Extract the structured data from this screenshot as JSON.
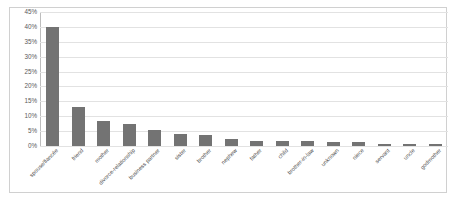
{
  "chart_data": {
    "type": "bar",
    "title": "",
    "subtitle": "",
    "xlabel": "",
    "ylabel": "",
    "ylim": [
      0,
      45
    ],
    "ytick_labels": [
      "0%",
      "5%",
      "10%",
      "15%",
      "20%",
      "25%",
      "30%",
      "35%",
      "40%",
      "45%"
    ],
    "ytick_values": [
      0,
      5,
      10,
      15,
      20,
      25,
      30,
      35,
      40,
      45
    ],
    "grid": true,
    "legend": null,
    "legend_position": "none",
    "bar_color": "#737373",
    "gridline_color": "#e2e2e2",
    "categories": [
      "spouse/fiancée",
      "friend",
      "mother",
      "divorce-relationship",
      "business partner",
      "sister",
      "brother",
      "nephew",
      "father",
      "child",
      "brother-in-law",
      "unknown",
      "niece",
      "servant",
      "uncle",
      "godmother"
    ],
    "values": [
      40,
      13,
      8.5,
      7.5,
      5.5,
      4,
      3.8,
      2.2,
      1.8,
      1.7,
      1.6,
      1.5,
      1.4,
      0.6,
      0.6,
      0.6
    ],
    "value_unit": "%"
  }
}
